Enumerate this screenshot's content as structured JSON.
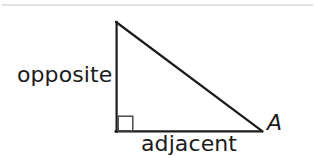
{
  "figure": {
    "type": "right-triangle-trigonometry-diagram",
    "background_color": "#ffffff",
    "stroke_color": "#1b1b1b",
    "divider_color": "#d8d8d8",
    "labels": {
      "opposite": "opposite",
      "adjacent": "adjacent",
      "angle": "A"
    },
    "geometry": {
      "apex": [
        116,
        22
      ],
      "right_angle_vertex": [
        116,
        131
      ],
      "angle_a_vertex": [
        262,
        131
      ],
      "right_angle_marker": {
        "x": 117,
        "y": 116,
        "size": 15
      },
      "stroke_width": 2.2
    },
    "divider": {
      "x1": 2,
      "y1": 5,
      "x2": 313,
      "y2": 5,
      "stroke_width": 1.4
    }
  }
}
